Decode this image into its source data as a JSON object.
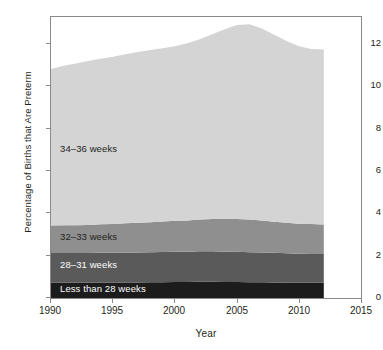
{
  "chart_data": {
    "type": "area",
    "stacked": true,
    "title": "",
    "xlabel": "Year",
    "ylabel": "Percentage of Births that Are Preterm",
    "xlim": [
      1990,
      2015
    ],
    "ylim": [
      0,
      13
    ],
    "xticks": [
      1990,
      1995,
      2000,
      2005,
      2010,
      2015
    ],
    "yticks": [
      0,
      2,
      4,
      6,
      8,
      10,
      12
    ],
    "grid": false,
    "legend_position": "inline-labels",
    "x": [
      1990,
      1991,
      1992,
      1993,
      1994,
      1995,
      1996,
      1997,
      1998,
      1999,
      2000,
      2001,
      2002,
      2003,
      2004,
      2005,
      2006,
      2007,
      2008,
      2009,
      2010,
      2011,
      2012
    ],
    "series": [
      {
        "name": "Less than 28 weeks",
        "color": "#1c1c1c",
        "label_color": "#ffffff",
        "values": [
          0.7,
          0.7,
          0.7,
          0.7,
          0.71,
          0.71,
          0.72,
          0.72,
          0.73,
          0.73,
          0.74,
          0.74,
          0.75,
          0.75,
          0.74,
          0.74,
          0.73,
          0.73,
          0.72,
          0.71,
          0.7,
          0.7,
          0.7
        ]
      },
      {
        "name": "28–31 weeks",
        "color": "#5a5a5a",
        "label_color": "#ffffff",
        "values": [
          1.38,
          1.38,
          1.38,
          1.38,
          1.38,
          1.38,
          1.39,
          1.39,
          1.39,
          1.4,
          1.4,
          1.4,
          1.41,
          1.41,
          1.4,
          1.4,
          1.39,
          1.38,
          1.37,
          1.36,
          1.35,
          1.34,
          1.33
        ]
      },
      {
        "name": "32–33 weeks",
        "color": "#8f8f8f",
        "label_color": "#231f20",
        "values": [
          1.27,
          1.28,
          1.29,
          1.3,
          1.32,
          1.33,
          1.35,
          1.37,
          1.39,
          1.41,
          1.43,
          1.45,
          1.47,
          1.49,
          1.51,
          1.52,
          1.51,
          1.48,
          1.44,
          1.41,
          1.39,
          1.38,
          1.37
        ]
      },
      {
        "name": "34–36 weeks",
        "color": "#d4d4d4",
        "label_color": "#231f20",
        "values": [
          7.25,
          7.38,
          7.48,
          7.58,
          7.66,
          7.74,
          7.82,
          7.9,
          7.96,
          8.02,
          8.08,
          8.19,
          8.34,
          8.55,
          8.78,
          8.97,
          9.04,
          8.88,
          8.65,
          8.41,
          8.21,
          8.1,
          8.1
        ]
      }
    ],
    "totals": [
      10.6,
      10.74,
      10.85,
      10.96,
      11.07,
      11.16,
      11.28,
      11.38,
      11.47,
      11.56,
      11.65,
      11.78,
      11.97,
      12.2,
      12.43,
      12.63,
      12.67,
      12.47,
      12.18,
      11.89,
      11.65,
      11.52,
      11.5
    ]
  },
  "axes": {
    "y_title": "Percentage of Births that Are Preterm",
    "x_title": "Year",
    "y_tick_labels": [
      "12",
      "10",
      "8",
      "6",
      "4",
      "2",
      "0"
    ],
    "x_tick_labels": [
      "1990",
      "1995",
      "2000",
      "2005",
      "2010",
      "2015"
    ]
  },
  "series_labels": [
    {
      "text": "34–36 weeks"
    },
    {
      "text": "32–33 weeks"
    },
    {
      "text": "28–31 weeks"
    },
    {
      "text": "Less than 28 weeks"
    }
  ]
}
